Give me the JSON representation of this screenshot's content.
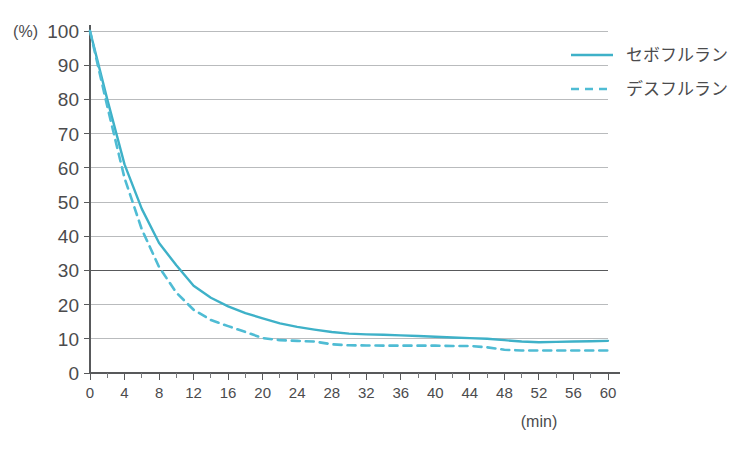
{
  "chart_data": {
    "type": "line",
    "title": "",
    "subtitle": "",
    "xlabel": "(min)",
    "ylabel": "(%)",
    "xlim": [
      0,
      60
    ],
    "ylim": [
      0,
      100
    ],
    "grid": true,
    "legend_position": "top-right",
    "x_ticks": [
      0,
      4,
      8,
      12,
      16,
      20,
      24,
      28,
      32,
      36,
      40,
      44,
      48,
      52,
      56,
      60
    ],
    "x_tick_labels": [
      "0",
      "4",
      "8",
      "12",
      "16",
      "20",
      "24",
      "28",
      "32",
      "36",
      "40",
      "44",
      "48",
      "52",
      "56",
      "60"
    ],
    "x_minor_tick_step": 2,
    "y_ticks": [
      0,
      10,
      20,
      30,
      40,
      50,
      60,
      70,
      80,
      90,
      100
    ],
    "y_tick_labels": [
      "0",
      "10",
      "20",
      "30",
      "40",
      "50",
      "60",
      "70",
      "80",
      "90",
      "100"
    ],
    "reference_lines": [
      {
        "name": "30-percent-line",
        "axis": "y",
        "value": 30,
        "color": "#58595b",
        "style": "solid"
      }
    ],
    "series": [
      {
        "name": "セボフルラン",
        "style": "solid",
        "color": "#3eb1c8",
        "x": [
          0,
          2,
          4,
          6,
          8,
          10,
          12,
          14,
          16,
          18,
          20,
          22,
          24,
          26,
          28,
          30,
          32,
          34,
          36,
          38,
          40,
          42,
          44,
          46,
          48,
          50,
          52,
          54,
          56,
          58,
          60
        ],
        "values": [
          100,
          80,
          61,
          48,
          38,
          31.5,
          25.5,
          22,
          19.5,
          17.5,
          16,
          14.5,
          13.5,
          12.7,
          12,
          11.5,
          11.3,
          11.2,
          11,
          10.8,
          10.6,
          10.4,
          10.2,
          10,
          9.6,
          9.2,
          9,
          9.1,
          9.2,
          9.3,
          9.4
        ]
      },
      {
        "name": "デスフルラン",
        "style": "dashed",
        "color": "#4fbcd4",
        "x": [
          0,
          2,
          4,
          6,
          8,
          10,
          12,
          14,
          16,
          18,
          20,
          22,
          24,
          26,
          28,
          30,
          32,
          34,
          36,
          38,
          40,
          42,
          44,
          46,
          48,
          50,
          52,
          54,
          56,
          58,
          60
        ],
        "values": [
          100,
          78,
          57,
          42,
          31,
          23.5,
          18.5,
          15.5,
          13.7,
          12,
          10.2,
          9.6,
          9.4,
          9.2,
          8.4,
          8.1,
          8.05,
          8.0,
          8.0,
          8.0,
          8.0,
          7.9,
          7.9,
          7.5,
          6.8,
          6.6,
          6.6,
          6.6,
          6.6,
          6.6,
          6.6
        ]
      }
    ],
    "colors": {
      "series_solid": "#3eb1c8",
      "series_dashed": "#4fbcd4",
      "grid": "#b9bbbd",
      "axis": "#58595b",
      "text": "#4b4b4d",
      "background": "#ffffff"
    }
  },
  "legend": {
    "items": [
      {
        "label": "セボフルラン",
        "style": "solid"
      },
      {
        "label": "デスフルラン",
        "style": "dashed"
      }
    ]
  }
}
